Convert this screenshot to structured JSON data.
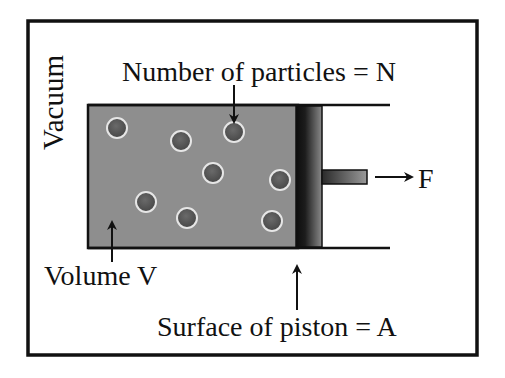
{
  "diagram": {
    "type": "piston-cylinder gas diagram",
    "labels": {
      "vacuum": "Vacuum",
      "particles": "Number of particles = N",
      "volume": "Volume V",
      "force": "F",
      "piston_surface": "Surface of piston = A"
    },
    "colors": {
      "frame": "#111111",
      "gas_fill": "#8c8c8c",
      "particle_fill": "#555555",
      "particle_ring": "#e6e6e6",
      "piston_dark": "#111111",
      "piston_light": "#6a6a6a"
    },
    "particles": [
      {
        "cx": 117,
        "cy": 128
      },
      {
        "cx": 181,
        "cy": 141
      },
      {
        "cx": 234,
        "cy": 132
      },
      {
        "cx": 213,
        "cy": 173
      },
      {
        "cx": 280,
        "cy": 180
      },
      {
        "cx": 146,
        "cy": 202
      },
      {
        "cx": 187,
        "cy": 218
      },
      {
        "cx": 272,
        "cy": 221
      }
    ]
  }
}
